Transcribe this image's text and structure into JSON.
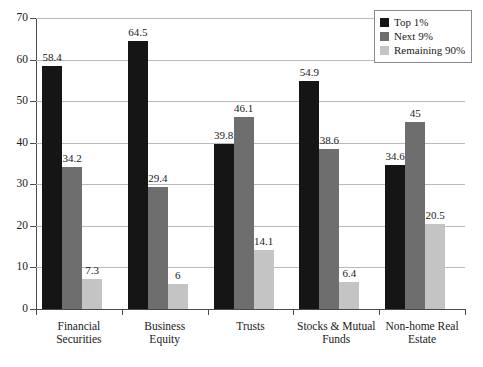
{
  "chart_data": {
    "type": "bar",
    "title": "",
    "xlabel": "",
    "ylabel": "",
    "ylim": [
      0,
      70
    ],
    "yticks": [
      0,
      10,
      20,
      30,
      40,
      50,
      60,
      70
    ],
    "grid": true,
    "legend_position": "top-right",
    "categories": [
      "Financial Securities",
      "Business Equity",
      "Trusts",
      "Stocks & Mutual Funds",
      "Non-home Real Estate"
    ],
    "category_lines": [
      [
        "Financial",
        "Securities"
      ],
      [
        "Business",
        "Equity"
      ],
      [
        "Trusts",
        ""
      ],
      [
        "Stocks & Mutual",
        "Funds"
      ],
      [
        "Non-home Real",
        "Estate"
      ]
    ],
    "series": [
      {
        "name": "Top 1%",
        "color": "#151515",
        "values": [
          58.4,
          64.5,
          39.8,
          54.9,
          34.6
        ],
        "labels": [
          "58.4",
          "64.5",
          "39.8",
          "54.9",
          "34.6"
        ]
      },
      {
        "name": "Next 9%",
        "color": "#6e6e6e",
        "values": [
          34.2,
          29.4,
          46.1,
          38.6,
          45
        ],
        "labels": [
          "34.2",
          "29.4",
          "46.1",
          "38.6",
          "45"
        ]
      },
      {
        "name": "Remaining 90%",
        "color": "#c4c4c4",
        "values": [
          7.3,
          6,
          14.1,
          6.4,
          20.5
        ],
        "labels": [
          "7.3",
          "6",
          "14.1",
          "6.4",
          "20.5"
        ]
      }
    ]
  },
  "legend": {
    "items": [
      {
        "label": "Top 1%",
        "color": "#151515"
      },
      {
        "label": "Next 9%",
        "color": "#6e6e6e"
      },
      {
        "label": "Remaining 90%",
        "color": "#c4c4c4"
      }
    ]
  },
  "axis": {
    "y_tick_labels": [
      "0",
      "10",
      "20",
      "30",
      "40",
      "50",
      "60",
      "70"
    ]
  }
}
